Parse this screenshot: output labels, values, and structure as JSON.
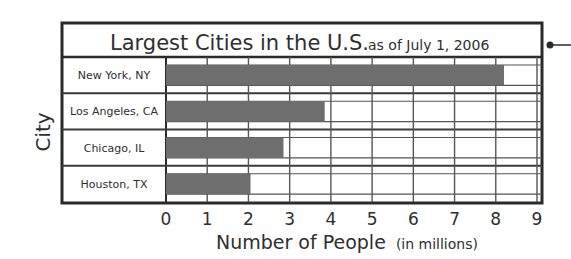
{
  "chart_data": {
    "type": "bar",
    "orientation": "horizontal",
    "title": "Largest Cities in the U.S.",
    "subtitle": "as of July 1, 2006",
    "xlabel": "Number of People",
    "xlabel_unit": "(in millions)",
    "ylabel": "City",
    "categories": [
      "New York, NY",
      "Los Angeles, CA",
      "Chicago, IL",
      "Houston, TX"
    ],
    "values": [
      8.2,
      3.85,
      2.85,
      2.05
    ],
    "xlim": [
      0,
      9
    ],
    "xticks": [
      "0",
      "1",
      "2",
      "3",
      "4",
      "5",
      "6",
      "7",
      "8",
      "9"
    ],
    "grid": true,
    "bar_color": "#6e6e6e"
  }
}
